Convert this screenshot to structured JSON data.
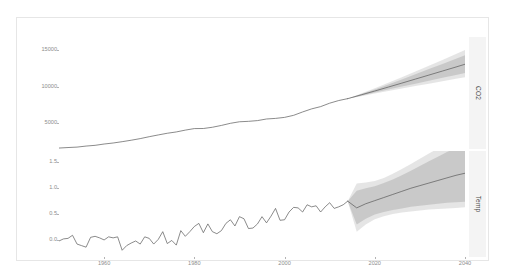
{
  "chart_data": {
    "type": "line",
    "title": "",
    "xlabel": "",
    "ylabel": "",
    "grid": false,
    "legend_position": "none",
    "facets": [
      {
        "name": "CO2",
        "strip_label": "CO2",
        "ylabel": "",
        "ylim": [
          1500,
          16800
        ],
        "yticks": [
          5000,
          10000,
          15000
        ],
        "ytick_labels": [
          "5000",
          "10000",
          "15000"
        ],
        "xlim": [
          1950,
          2040
        ],
        "history": {
          "name": "observed",
          "color": "#595959",
          "x": [
            1950,
            1952,
            1954,
            1956,
            1958,
            1960,
            1962,
            1964,
            1966,
            1968,
            1970,
            1972,
            1974,
            1976,
            1978,
            1980,
            1982,
            1984,
            1986,
            1988,
            1990,
            1992,
            1994,
            1996,
            1998,
            2000,
            2002,
            2004,
            2006,
            2008,
            2010,
            2012,
            2014
          ],
          "y": [
            1630,
            1700,
            1760,
            1900,
            2000,
            2180,
            2320,
            2500,
            2700,
            2920,
            3180,
            3420,
            3650,
            3830,
            4080,
            4290,
            4300,
            4470,
            4720,
            5010,
            5220,
            5280,
            5380,
            5600,
            5680,
            5820,
            6100,
            6560,
            6980,
            7290,
            7760,
            8120,
            8380
          ]
        },
        "forecast": {
          "name": "forecast",
          "color": "#595959",
          "band_color": "#aaaaaa",
          "band_opacity": 0.55,
          "x": [
            2014,
            2017,
            2020,
            2023,
            2026,
            2029,
            2032,
            2035,
            2038,
            2040
          ],
          "mean": [
            8380,
            8900,
            9420,
            9960,
            10500,
            11050,
            11600,
            12150,
            12700,
            13080
          ],
          "lower80": [
            8380,
            8790,
            9210,
            9620,
            10030,
            10430,
            10830,
            11230,
            11620,
            11890
          ],
          "upper80": [
            8380,
            9020,
            9640,
            10320,
            11000,
            11700,
            12420,
            13120,
            13830,
            14320
          ],
          "lower95": [
            8380,
            8720,
            9080,
            9420,
            9760,
            10090,
            10420,
            10750,
            11080,
            11300
          ],
          "upper95": [
            8380,
            9090,
            9790,
            10540,
            11300,
            12080,
            12880,
            13670,
            14470,
            15010
          ]
        }
      },
      {
        "name": "Temp",
        "strip_label": "Temp",
        "ylabel": "",
        "ylim": [
          -0.33,
          1.72
        ],
        "yticks": [
          0.0,
          0.5,
          1.0,
          1.5
        ],
        "ytick_labels": [
          "0.0",
          "0.5",
          "1.0",
          "1.5"
        ],
        "xlim": [
          1950,
          2040
        ],
        "history": {
          "name": "observed",
          "color": "#595959",
          "x": [
            1950,
            1951,
            1952,
            1953,
            1954,
            1955,
            1956,
            1957,
            1958,
            1959,
            1960,
            1961,
            1962,
            1963,
            1964,
            1965,
            1966,
            1967,
            1968,
            1969,
            1970,
            1971,
            1972,
            1973,
            1974,
            1975,
            1976,
            1977,
            1978,
            1979,
            1980,
            1981,
            1982,
            1983,
            1984,
            1985,
            1986,
            1987,
            1988,
            1989,
            1990,
            1991,
            1992,
            1993,
            1994,
            1995,
            1996,
            1997,
            1998,
            1999,
            2000,
            2001,
            2002,
            2003,
            2004,
            2005,
            2006,
            2007,
            2008,
            2009,
            2010,
            2011,
            2012,
            2013,
            2014
          ],
          "y": [
            -0.02,
            0.02,
            0.03,
            0.09,
            -0.08,
            -0.11,
            -0.14,
            0.05,
            0.07,
            0.04,
            0.0,
            0.06,
            0.04,
            0.06,
            -0.2,
            -0.11,
            -0.06,
            -0.02,
            -0.08,
            0.06,
            0.03,
            -0.08,
            0.01,
            0.16,
            -0.07,
            -0.01,
            -0.1,
            0.18,
            0.07,
            0.16,
            0.26,
            0.32,
            0.14,
            0.31,
            0.16,
            0.12,
            0.18,
            0.32,
            0.39,
            0.27,
            0.45,
            0.41,
            0.22,
            0.23,
            0.31,
            0.45,
            0.33,
            0.46,
            0.61,
            0.38,
            0.39,
            0.54,
            0.63,
            0.62,
            0.54,
            0.68,
            0.64,
            0.66,
            0.54,
            0.64,
            0.72,
            0.61,
            0.64,
            0.68,
            0.75
          ]
        },
        "forecast": {
          "name": "forecast",
          "color": "#595959",
          "band_color": "#aaaaaa",
          "band_opacity": 0.55,
          "x": [
            2014,
            2016,
            2018,
            2020,
            2022,
            2024,
            2026,
            2028,
            2030,
            2032,
            2034,
            2036,
            2038,
            2040
          ],
          "mean": [
            0.75,
            0.62,
            0.7,
            0.76,
            0.82,
            0.88,
            0.94,
            1.0,
            1.05,
            1.1,
            1.15,
            1.2,
            1.25,
            1.29
          ],
          "lower80": [
            0.75,
            0.3,
            0.41,
            0.49,
            0.54,
            0.58,
            0.61,
            0.64,
            0.66,
            0.68,
            0.7,
            0.72,
            0.73,
            0.74
          ],
          "upper80": [
            0.75,
            0.95,
            1.0,
            1.04,
            1.1,
            1.17,
            1.25,
            1.34,
            1.43,
            1.52,
            1.61,
            1.7,
            1.78,
            1.84
          ],
          "lower95": [
            0.75,
            0.16,
            0.3,
            0.4,
            0.46,
            0.5,
            0.53,
            0.55,
            0.57,
            0.59,
            0.6,
            0.61,
            0.62,
            0.63
          ],
          "upper95": [
            0.75,
            1.09,
            1.11,
            1.14,
            1.2,
            1.28,
            1.37,
            1.47,
            1.57,
            1.67,
            1.77,
            1.87,
            1.96,
            2.03
          ]
        }
      }
    ],
    "xticks": [
      1960,
      1980,
      2000,
      2020,
      2040
    ],
    "xtick_labels": [
      "1960",
      "1980",
      "2000",
      "2020",
      "2040"
    ]
  },
  "colors": {
    "panel_background": "#ffffff",
    "frame_border": "#e6e6e6",
    "strip_background": "#f4f4f4",
    "axis_text": "#8c8c8c",
    "strip_text": "#4d4d4d",
    "line": "#595959",
    "band": "#aaaaaa"
  }
}
